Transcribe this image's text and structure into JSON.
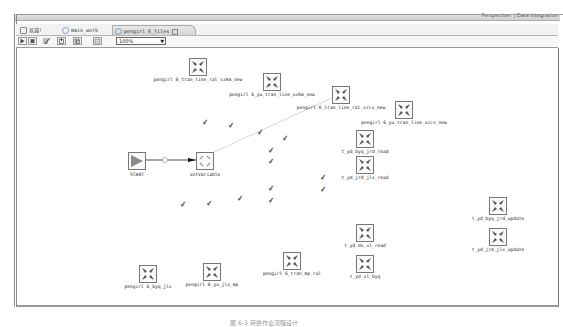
{
  "perspective": {
    "label": "Perspective: | Data Integration"
  },
  "tabs": [
    {
      "label": "欢迎!",
      "active": false
    },
    {
      "label": "main_work",
      "active": false
    },
    {
      "label": "pengirl 6_files",
      "active": true
    }
  ],
  "toolbar": {
    "buttons": [
      "run-icon",
      "stop-icon",
      "edit-icon",
      "import-icon",
      "export-icon",
      "grid-icon"
    ],
    "zoom_value": "100%"
  },
  "canvas": {
    "start": {
      "label": "START"
    },
    "set_variable": {
      "label": "setVariable"
    },
    "hop_label": "①",
    "nodes": [
      {
        "label": "pengirl 6_tran_line_ral_szkm_new",
        "x": 198,
        "y": 70
      },
      {
        "label": "pengirl 6_yu_tran_line_szkm_new",
        "x": 272,
        "y": 85
      },
      {
        "label": "pengirl 6_tran_line_ral_szcs_new",
        "x": 341,
        "y": 98
      },
      {
        "label": "pengirl 6_yu_tran_line_szcs_new",
        "x": 404,
        "y": 113
      },
      {
        "label": "t_yd_byq_jrd_read",
        "x": 365,
        "y": 142
      },
      {
        "label": "t_yd_jrd_jlx_read",
        "x": 365,
        "y": 168
      },
      {
        "label": "t_yd_byq_jrd_update",
        "x": 498,
        "y": 209
      },
      {
        "label": "t_yd_jrd_jlx_update",
        "x": 498,
        "y": 240
      },
      {
        "label": "t_yd_dx_xl_read",
        "x": 365,
        "y": 236
      },
      {
        "label": "t_yd_xl_byq",
        "x": 365,
        "y": 267
      },
      {
        "label": "pengirl 6_tran_mp_ral",
        "x": 292,
        "y": 264
      },
      {
        "label": "pengirl 6_yu_jlx_mp",
        "x": 212,
        "y": 275
      },
      {
        "label": "pengirl 6_byq_jlx",
        "x": 148,
        "y": 277
      }
    ]
  },
  "caption": "图 6-3  转换作业流程设计"
}
